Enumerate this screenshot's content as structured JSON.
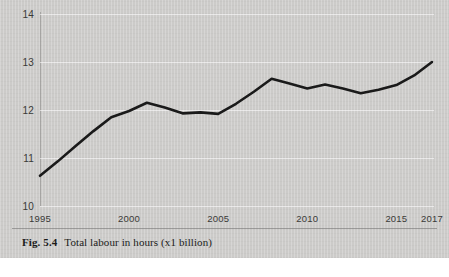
{
  "figure": {
    "caption_number": "Fig. 5.4",
    "caption_text": "Total labour in hours (x1 billion)",
    "background_color": "#cccbc9",
    "line_color": "#1a1a1a"
  },
  "chart_data": {
    "type": "line",
    "title": "Total labour in hours (x1 billion)",
    "xlabel": "",
    "ylabel": "",
    "xlim": [
      1995,
      2017
    ],
    "ylim": [
      10,
      14
    ],
    "grid": true,
    "legend": null,
    "y_ticks": [
      14,
      13,
      12,
      11,
      10
    ],
    "y_tick_labels": [
      "14",
      "13",
      "12",
      "11",
      "10"
    ],
    "x_ticks": [
      1995,
      2000,
      2005,
      2010,
      2015,
      2017
    ],
    "x_tick_labels": [
      "1995",
      "2000",
      "2005",
      "2010",
      "2015",
      "2017"
    ],
    "x": [
      1995,
      1996,
      1997,
      1998,
      1999,
      2000,
      2001,
      2002,
      2003,
      2004,
      2005,
      2006,
      2007,
      2008,
      2009,
      2010,
      2011,
      2012,
      2013,
      2014,
      2015,
      2016,
      2017
    ],
    "series": [
      {
        "name": "Total labour in hours",
        "values": [
          10.63,
          10.93,
          11.25,
          11.56,
          11.85,
          11.98,
          12.15,
          12.05,
          11.93,
          11.95,
          11.92,
          12.13,
          12.38,
          12.65,
          12.55,
          12.45,
          12.53,
          12.45,
          12.35,
          12.42,
          12.52,
          12.72,
          13.0
        ]
      }
    ]
  }
}
